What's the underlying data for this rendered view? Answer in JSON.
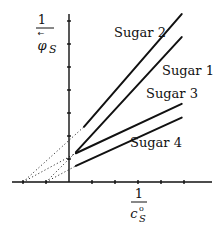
{
  "chart_data": {
    "type": "line",
    "title": "",
    "xlabel": {
      "numerator": "1",
      "denominator": "c",
      "denominator_sup": "o",
      "denominator_sub": "S"
    },
    "ylabel": {
      "numerator": "1",
      "denominator": "φ",
      "denominator_sub": "S",
      "overarrow": "←"
    },
    "xlim": [
      -2.5,
      6
    ],
    "ylim": [
      0,
      7
    ],
    "x_ticks": [
      -2,
      -1,
      1,
      2,
      3,
      4,
      5
    ],
    "y_ticks": [
      1,
      2,
      3,
      4,
      5,
      6,
      7
    ],
    "grid": false,
    "legend": "inline-labels",
    "series": [
      {
        "name": "Sugar 2",
        "x_solid": [
          0.65,
          4.9
        ],
        "y_solid": [
          2.4,
          7.3
        ],
        "x_extrap": [
          -2,
          0.65
        ],
        "y_extrap": [
          0,
          2.4
        ]
      },
      {
        "name": "Sugar 1",
        "x_solid": [
          0.3,
          4.9
        ],
        "y_solid": [
          1.3,
          6.3
        ],
        "x_extrap": [
          -1,
          0.3
        ],
        "y_extrap": [
          0,
          1.3
        ]
      },
      {
        "name": "Sugar 3",
        "x_solid": [
          0.3,
          4.9
        ],
        "y_solid": [
          1.25,
          3.4
        ],
        "x_extrap": [
          -2,
          0.3
        ],
        "y_extrap": [
          0,
          1.25
        ]
      },
      {
        "name": "Sugar 4",
        "x_solid": [
          0.3,
          4.9
        ],
        "y_solid": [
          0.7,
          2.8
        ],
        "x_extrap": [
          -1,
          0.3
        ],
        "y_extrap": [
          0,
          0.7
        ]
      }
    ],
    "annotations": [
      "Sugar 2",
      "Sugar 1",
      "Sugar 3",
      "Sugar 4"
    ]
  }
}
